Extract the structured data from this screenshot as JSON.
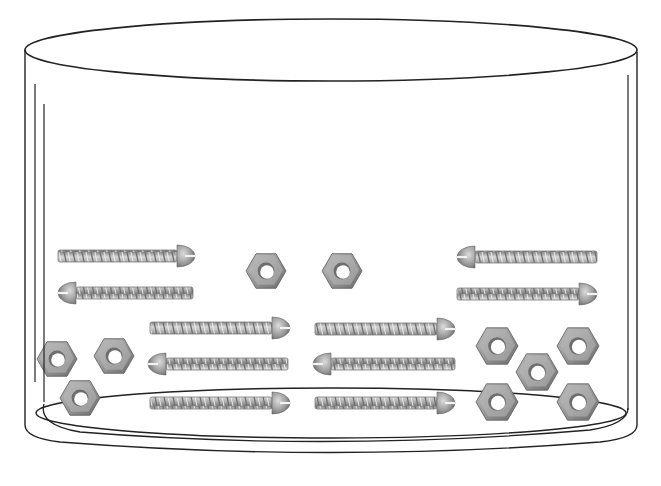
{
  "scene": {
    "title": "Container of screws and nuts",
    "background": "#ffffff",
    "line_color": "#222222",
    "metal_light": "#d8d8d8",
    "metal_mid": "#a8a8a8",
    "metal_dark": "#6e6e6e"
  },
  "container": {
    "top_ellipse": {
      "cx": 331,
      "cy": 50,
      "rx": 306,
      "ry": 31
    },
    "bottom_inner_ellipse": {
      "cx": 331,
      "cy": 413,
      "rx": 295,
      "ry": 25
    },
    "outer_left_x": 25,
    "outer_right_x": 637,
    "outer_bottom_y": 455
  },
  "counts": {
    "screws": 10,
    "nuts": 10
  },
  "screws": [
    {
      "x": 58,
      "y": 256,
      "length": 137,
      "head": "right"
    },
    {
      "x": 58,
      "y": 293,
      "length": 135,
      "head": "left"
    },
    {
      "x": 457,
      "y": 257,
      "length": 140,
      "head": "left"
    },
    {
      "x": 457,
      "y": 294,
      "length": 140,
      "head": "right"
    },
    {
      "x": 150,
      "y": 328,
      "length": 140,
      "head": "right"
    },
    {
      "x": 148,
      "y": 364,
      "length": 140,
      "head": "left"
    },
    {
      "x": 150,
      "y": 403,
      "length": 140,
      "head": "right"
    },
    {
      "x": 315,
      "y": 329,
      "length": 140,
      "head": "right"
    },
    {
      "x": 313,
      "y": 364,
      "length": 142,
      "head": "left"
    },
    {
      "x": 315,
      "y": 403,
      "length": 140,
      "head": "right"
    }
  ],
  "nuts": [
    {
      "cx": 266,
      "cy": 271,
      "r": 20
    },
    {
      "cx": 342,
      "cy": 271,
      "r": 20
    },
    {
      "cx": 57,
      "cy": 359,
      "r": 20
    },
    {
      "cx": 114,
      "cy": 356,
      "r": 20
    },
    {
      "cx": 80,
      "cy": 398,
      "r": 20
    },
    {
      "cx": 497,
      "cy": 346,
      "r": 21
    },
    {
      "cx": 578,
      "cy": 346,
      "r": 21
    },
    {
      "cx": 537,
      "cy": 372,
      "r": 21
    },
    {
      "cx": 497,
      "cy": 402,
      "r": 21
    },
    {
      "cx": 578,
      "cy": 402,
      "r": 21
    }
  ]
}
